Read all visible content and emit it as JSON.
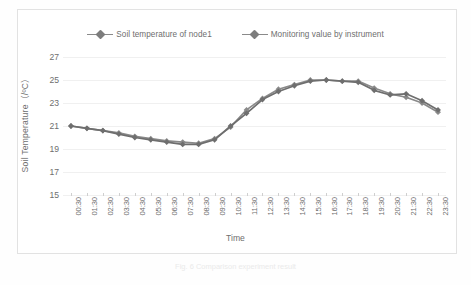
{
  "figure": {
    "caption": "Fig. 6  Comparison experiment result"
  },
  "legend": {
    "position": "top-center",
    "entries": [
      {
        "label": "Soil temperature of node1",
        "color": "#7d7d7d",
        "marker": "diamond-marker"
      },
      {
        "label": "Monitoring value by instrument",
        "color": "#6e6e6e",
        "marker": "diamond-marker"
      }
    ]
  },
  "axes": {
    "y_title": "Soil Temperature（/ºC）",
    "x_title": "Time"
  },
  "chart_data": {
    "type": "line",
    "title": "",
    "subtitle": "",
    "xlabel": "Time",
    "ylabel": "Soil Temperature（/ºC）",
    "ylim": [
      15,
      27
    ],
    "yticks": [
      15,
      17,
      19,
      21,
      23,
      25,
      27
    ],
    "grid": true,
    "legend_position": "top-center",
    "categories": [
      "00:30",
      "01:30",
      "02:30",
      "03:30",
      "04:30",
      "05:30",
      "06:30",
      "07:30",
      "08:30",
      "09:30",
      "10:30",
      "11:30",
      "12:30",
      "13:30",
      "14:30",
      "15:30",
      "16:30",
      "17:30",
      "18:30",
      "19:30",
      "20:30",
      "21:30",
      "22:30",
      "23:30"
    ],
    "series": [
      {
        "name": "Soil temperature of node1",
        "color": "#8a8a8a",
        "values": [
          21.0,
          20.8,
          20.6,
          20.4,
          20.1,
          19.9,
          19.7,
          19.6,
          19.5,
          19.9,
          20.9,
          22.4,
          23.4,
          24.2,
          24.6,
          25.0,
          25.0,
          24.9,
          24.9,
          24.3,
          23.8,
          23.5,
          23.0,
          22.2
        ]
      },
      {
        "name": "Monitoring value by instrument",
        "color": "#6e6e6e",
        "values": [
          21.0,
          20.8,
          20.6,
          20.3,
          20.0,
          19.8,
          19.6,
          19.4,
          19.4,
          19.8,
          21.0,
          22.1,
          23.3,
          24.0,
          24.5,
          24.9,
          25.0,
          24.9,
          24.8,
          24.1,
          23.7,
          23.8,
          23.2,
          22.4
        ]
      }
    ]
  }
}
